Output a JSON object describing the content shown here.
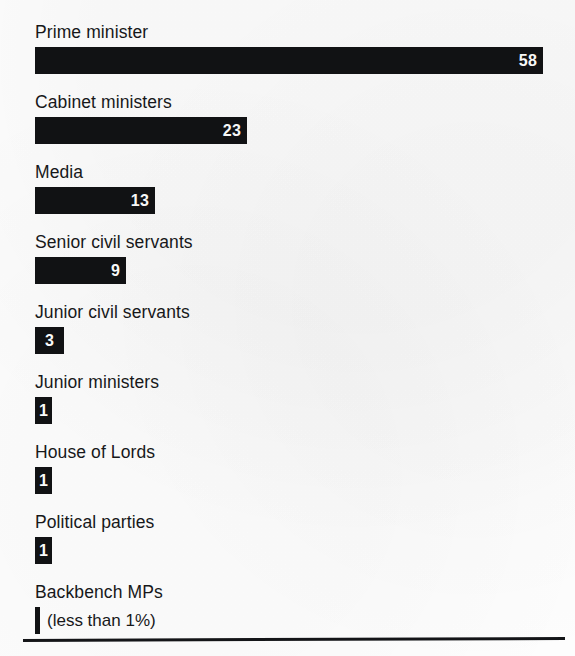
{
  "chart_data": {
    "type": "bar",
    "title": "",
    "subtitle": "",
    "xlabel": "",
    "ylabel": "",
    "orientation": "horizontal",
    "grid": false,
    "legend": null,
    "axis_visible": false,
    "units": "percent",
    "xlim": [
      0,
      58
    ],
    "categories": [
      "Prime minister",
      "Cabinet ministers",
      "Media",
      "Senior civil servants",
      "Junior civil servants",
      "Junior ministers",
      "House of Lords",
      "Political parties",
      "Backbench MPs"
    ],
    "values": [
      58,
      23,
      13,
      9,
      3,
      1,
      1,
      1,
      0.5
    ],
    "value_labels": [
      "58",
      "23",
      "13",
      "9",
      "3",
      "1",
      "1",
      "1",
      ""
    ],
    "annotations": [
      {
        "category": "Backbench MPs",
        "text": "(less than 1%)"
      }
    ],
    "bar_color": "#111214",
    "value_label_color": "#ffffff",
    "background_color": "#fdfdfd"
  },
  "rows": [
    {
      "label": "Prime minister",
      "value": "58",
      "width_px": 508,
      "note": "",
      "style": "wide"
    },
    {
      "label": "Cabinet ministers",
      "value": "23",
      "width_px": 212,
      "note": "",
      "style": "wide"
    },
    {
      "label": "Media",
      "value": "13",
      "width_px": 120,
      "note": "",
      "style": "wide"
    },
    {
      "label": "Senior civil servants",
      "value": "9",
      "width_px": 91,
      "note": "",
      "style": "wide"
    },
    {
      "label": "Junior civil servants",
      "value": "3",
      "width_px": 29,
      "note": "",
      "style": "narrow"
    },
    {
      "label": "Junior ministers",
      "value": "1",
      "width_px": 17,
      "note": "",
      "style": "narrow"
    },
    {
      "label": "House of Lords",
      "value": "1",
      "width_px": 17,
      "note": "",
      "style": "narrow"
    },
    {
      "label": "Political parties",
      "value": "1",
      "width_px": 17,
      "note": "",
      "style": "narrow"
    },
    {
      "label": "Backbench MPs",
      "value": "",
      "width_px": 5,
      "note": "(less than 1%)",
      "style": "sliver"
    }
  ],
  "footer": {
    "rule_color": "#141518"
  }
}
